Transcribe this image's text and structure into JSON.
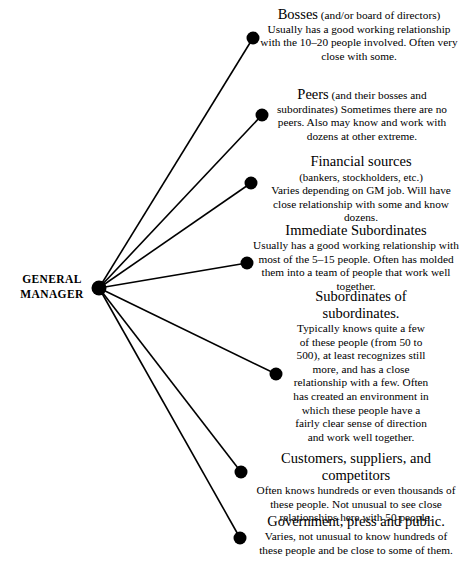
{
  "diagram": {
    "title_node": {
      "label_line1": "GENERAL",
      "label_line2": "MANAGER",
      "dot_color": "#000000"
    },
    "line_color": "#000000",
    "nodes": [
      {
        "id": "bosses",
        "heading": "Bosses",
        "heading_inline_rest": " (and/or board of",
        "body": "directors) Usually has a good working relationship with the 10–20 people involved. Often very close with some."
      },
      {
        "id": "peers",
        "heading": "Peers",
        "heading_inline_rest": " (and their bosses and",
        "body": "subordinates) Sometimes there are no peers. Also may know and work with dozens at other extreme."
      },
      {
        "id": "financial",
        "heading": "Financial sources",
        "subhead": "(bankers, stockholders, etc.)",
        "body": "Varies depending on GM job. Will have close relationship with some and know dozens."
      },
      {
        "id": "immediate",
        "heading": "Immediate Subordinates",
        "body": "Usually has a good working relationship with most of the 5–15 people. Often has molded them into a team of people that work well together."
      },
      {
        "id": "subsub",
        "heading": "Subordinates of subordinates.",
        "body": "Typically knows quite a few of these people (from 50 to 500), at least recognizes still more, and has a close relationship with a few. Often has created an environment in which these people have a fairly clear sense of direction and work well together."
      },
      {
        "id": "customers",
        "heading": "Customers, suppliers, and competitors",
        "body": "Often knows hundreds or even thousands of these people. Not unusual to see close relationships here with 50 people."
      },
      {
        "id": "government",
        "heading": "Government, press and public.",
        "body": "Varies, not unusual to know hundreds of these people and be close to some of them."
      }
    ]
  },
  "chart_data": {
    "type": "diagram",
    "hub": {
      "label": "GENERAL MANAGER",
      "x": 99,
      "y": 288,
      "r": 7.5
    },
    "endpoints": [
      {
        "label": "Bosses",
        "x": 253,
        "y": 38,
        "r": 6.5
      },
      {
        "label": "Peers",
        "x": 262,
        "y": 115,
        "r": 6.5
      },
      {
        "label": "Financial sources",
        "x": 251,
        "y": 183,
        "r": 6.5
      },
      {
        "label": "Immediate Subordinates",
        "x": 247,
        "y": 263,
        "r": 6.5
      },
      {
        "label": "Subordinates of subordinates",
        "x": 276,
        "y": 374,
        "r": 6.5
      },
      {
        "label": "Customers, suppliers, and competitors",
        "x": 241,
        "y": 472,
        "r": 6.5
      },
      {
        "label": "Government, press and public",
        "x": 240,
        "y": 538,
        "r": 6.5
      }
    ]
  }
}
